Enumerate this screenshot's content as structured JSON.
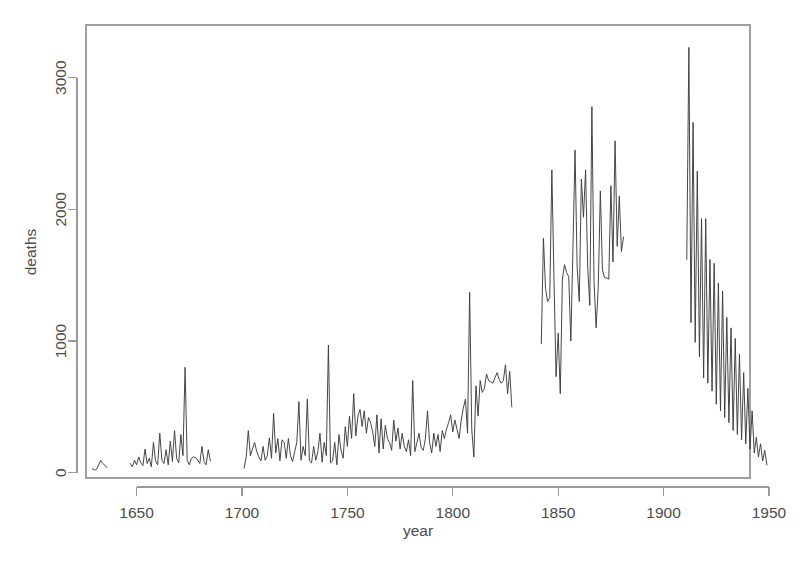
{
  "chart_data": {
    "type": "line",
    "title": "",
    "xlabel": "year",
    "ylabel": "deaths",
    "xlim": [
      1626,
      1941
    ],
    "ylim": [
      -40,
      3400
    ],
    "grid": false,
    "legend": "none",
    "line_color": "#3c3c3c",
    "axis_color": "#9a9a9a",
    "text_color": "#4c4c4c",
    "background": "#ffffff",
    "x_ticks": [
      1650,
      1700,
      1750,
      1800,
      1850,
      1900,
      1950
    ],
    "x_tick_labels": [
      "1650",
      "1700",
      "1750",
      "1800",
      "1850",
      "1900",
      "1950"
    ],
    "y_ticks": [
      0,
      1000,
      2000,
      3000
    ],
    "y_tick_labels": [
      "0",
      "1000",
      "2000",
      "3000"
    ],
    "series": [
      {
        "name": "deaths",
        "segments": [
          {
            "start_year": 1629,
            "values": [
              30,
              20,
              25,
              60,
              95,
              70,
              55,
              40
            ]
          },
          {
            "start_year": 1647,
            "values": [
              70,
              45,
              95,
              60,
              120,
              75,
              55,
              180,
              70,
              110,
              45,
              230,
              90,
              60,
              300,
              95,
              70,
              175,
              60,
              240,
              85,
              320,
              110,
              75,
              290,
              130,
              800,
              95,
              60,
              110,
              120,
              115,
              95,
              70,
              200,
              85,
              60,
              175,
              90
            ]
          },
          {
            "start_year": 1701,
            "values": [
              35,
              120,
              320,
              130,
              180,
              230,
              160,
              120,
              90,
              200,
              95,
              130,
              265,
              110,
              450,
              150,
              260,
              90,
              250,
              230,
              110,
              260,
              130,
              85,
              160,
              230,
              540,
              95,
              200,
              130,
              560,
              90,
              75,
              200,
              95,
              160,
              300,
              80,
              230,
              130,
              970,
              75,
              90,
              230,
              60,
              290,
              170,
              110,
              350,
              200,
              430,
              260,
              600,
              280,
              430,
              480,
              350,
              470,
              300,
              420,
              380,
              310,
              200,
              440,
              150,
              410,
              180,
              360,
              260,
              230,
              170,
              400,
              240,
              340,
              180,
              300,
              200,
              160,
              250,
              130,
              700,
              160,
              230,
              300,
              190,
              170,
              260,
              470,
              230,
              150,
              300,
              200,
              290,
              160,
              320,
              260,
              330,
              380,
              440,
              310,
              400,
              330,
              260,
              400,
              490,
              560,
              300,
              1370,
              330,
              120,
              660,
              430,
              700,
              610,
              640,
              750,
              700,
              690,
              680,
              720,
              760,
              710,
              680,
              700,
              820,
              600,
              770,
              500
            ]
          },
          {
            "start_year": 1842,
            "values": [
              980,
              1780,
              1400,
              1300,
              1330,
              2300,
              1480,
              730,
              1060,
              600,
              1470,
              1580,
              1520,
              1490,
              1000,
              1700,
              2450,
              1560,
              1300,
              2230,
              1940,
              2300,
              1560,
              1270,
              2780,
              1460,
              1100,
              1400,
              2140,
              1540,
              1480,
              1480,
              1470,
              2180,
              1600,
              2520,
              1720,
              2100,
              1680,
              1790
            ]
          },
          {
            "start_year": 1911,
            "values": [
              1620,
              3230,
              1140,
              2660,
              990,
              2290,
              880,
              1930,
              720,
              1930,
              680,
              1620,
              620,
              1590,
              520,
              1440,
              470,
              1380,
              420,
              1180,
              380,
              1100,
              320,
              1020,
              290,
              900,
              250,
              760,
              220,
              640,
              180,
              470,
              150,
              270,
              120,
              220,
              90,
              170,
              60
            ]
          }
        ]
      }
    ]
  },
  "geometry": {
    "plot_left": 86,
    "plot_right": 750,
    "plot_top": 25,
    "plot_bottom": 478
  }
}
